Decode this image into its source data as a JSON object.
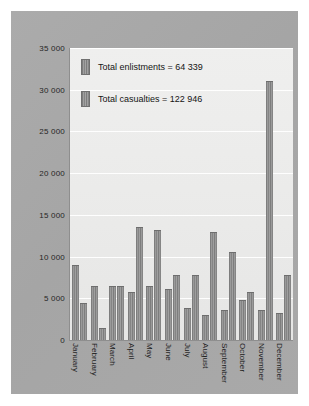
{
  "chart_data": {
    "type": "bar",
    "title": "",
    "xlabel": "",
    "ylabel": "",
    "ylim": [
      0,
      35000
    ],
    "ytick_step": 5000,
    "grid": true,
    "legend_position": "inside-top-left",
    "categories": [
      "January",
      "February",
      "March",
      "April",
      "May",
      "June",
      "July",
      "August",
      "September",
      "October",
      "November",
      "December"
    ],
    "ytick_labels": [
      "35 000",
      "30 000",
      "25 000",
      "20 000",
      "15 000",
      "10 000",
      "5 000",
      "0"
    ],
    "ytick_values": [
      35000,
      30000,
      25000,
      20000,
      15000,
      10000,
      5000,
      0
    ],
    "series": [
      {
        "name": "Total enlistments",
        "total": 64339,
        "total_label": "Total enlistments = 64 339",
        "color": "#8c8c8c",
        "values": [
          9000,
          6500,
          6500,
          5700,
          6500,
          6100,
          3800,
          2950,
          3600,
          4800,
          3600,
          3200
        ]
      },
      {
        "name": "Total casualties",
        "total": 122946,
        "total_label": "Total casualties = 122 946",
        "color": "#8c8c8c",
        "values": [
          4400,
          1400,
          6500,
          13600,
          13200,
          7800,
          7750,
          13000,
          10600,
          5800,
          31000,
          7750
        ]
      }
    ]
  },
  "legend": {
    "items": [
      {
        "label": "Total enlistments = 64 339"
      },
      {
        "label": "Total casualties = 122 946"
      }
    ]
  },
  "colors": {
    "page_background": "#ffffff",
    "panel_background": "#a8a8a8",
    "plot_background": "#ececeb",
    "bar": "#8c8c8c",
    "gridline": "#ffffff",
    "axis": "#8e8e8e",
    "text": "#1f1f1f"
  }
}
